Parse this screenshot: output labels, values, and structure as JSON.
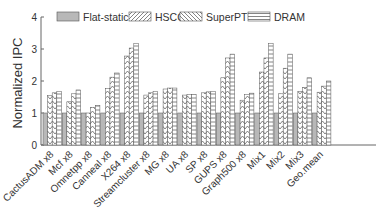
{
  "chart_data": {
    "type": "bar",
    "title": "",
    "xlabel": "",
    "ylabel": "Normalized IPC",
    "ylim": [
      0,
      4
    ],
    "yticks": [
      0,
      1,
      2,
      3,
      4
    ],
    "grid": false,
    "legend_position": "top",
    "categories": [
      "CactusADM x8",
      "Mcf x8",
      "Omnetpp x8",
      "Canneal x8",
      "X264 x8",
      "Streamcluster x8",
      "MG x8",
      "UA x8",
      "SP x8",
      "GUPS x8",
      "Graph500 x8",
      "Mix1",
      "Mix2",
      "Mix3",
      "Geo.mean"
    ],
    "series": [
      {
        "name": "Flat-static",
        "pattern": "solid",
        "values": [
          1,
          1,
          1,
          1,
          1,
          1,
          1,
          1,
          1,
          1,
          1,
          1,
          1,
          1,
          1
        ]
      },
      {
        "name": "HSCC",
        "pattern": "diagonal",
        "values": [
          1.55,
          1.35,
          1.0,
          1.77,
          2.78,
          1.56,
          1.75,
          1.56,
          1.63,
          2.1,
          1.4,
          2.28,
          1.6,
          1.68,
          1.65
        ]
      },
      {
        "name": "SuperPT",
        "pattern": "backdiagonal",
        "values": [
          1.63,
          1.6,
          1.18,
          2.12,
          3.03,
          1.63,
          1.78,
          1.58,
          1.66,
          2.72,
          1.58,
          2.72,
          2.4,
          1.8,
          1.84
        ]
      },
      {
        "name": "DRAM",
        "pattern": "horizontal",
        "values": [
          1.68,
          1.72,
          1.24,
          2.25,
          3.18,
          1.68,
          1.78,
          1.58,
          1.68,
          2.84,
          1.62,
          3.18,
          2.84,
          2.1,
          2.0
        ]
      }
    ]
  },
  "colors": {
    "bar_fill": "#b8b8b8",
    "pattern_bg": "#ffffff",
    "stroke": "#555555",
    "axis": "#666666"
  }
}
